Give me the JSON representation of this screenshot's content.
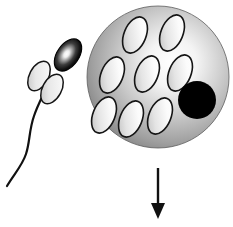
{
  "figure": {
    "width": 233,
    "height": 227,
    "background_color": "#ffffff"
  },
  "colors": {
    "outline": "#111111",
    "sperm_head_dark": "#0b0b0b",
    "sperm_head_highlight": "#ffffff",
    "sperm_midpiece_light": "#f2f2f2",
    "sperm_midpiece_shade": "#bdbdbd",
    "egg_edge_dark": "#5e5e5e",
    "egg_mid_gray": "#9a9a9a",
    "egg_highlight": "#ffffff",
    "vesicle_light": "#fbfbfb",
    "vesicle_shade": "#c4c4c4",
    "nucleus_black": "#000000",
    "arrow_black": "#111111"
  },
  "sperm": {
    "label": "sperm-cell",
    "head": {
      "label": "sperm-head-acrosome",
      "cx": 68,
      "cy": 55,
      "rx": 11,
      "ry": 18,
      "rotation": 35
    },
    "midpiece_ellipses": [
      {
        "label": "sperm-midpiece-upper-left",
        "cx": 39,
        "cy": 76,
        "rx": 9.5,
        "ry": 16,
        "rotation": 28
      },
      {
        "label": "sperm-midpiece-lower-right",
        "cx": 52,
        "cy": 89,
        "rx": 9.5,
        "ry": 16,
        "rotation": 28
      }
    ],
    "tail": {
      "label": "sperm-flagellum-tail",
      "stroke_width": 2.2,
      "path": "M 50 80 C 44 94, 38 104, 34 116 C 29 130, 30 142, 26 154 C 22 166, 14 174, 7 186"
    }
  },
  "egg": {
    "label": "egg-cell-oocyte",
    "cx": 158,
    "cy": 77,
    "r": 71,
    "vesicles": [
      {
        "label": "vesicle-top-left",
        "cx": 135,
        "cy": 35,
        "rx": 11,
        "ry": 19,
        "rotation": 22
      },
      {
        "label": "vesicle-top-right",
        "cx": 172,
        "cy": 33,
        "rx": 11,
        "ry": 19,
        "rotation": 22
      },
      {
        "label": "vesicle-middle-left",
        "cx": 112,
        "cy": 75,
        "rx": 11,
        "ry": 19,
        "rotation": 22
      },
      {
        "label": "vesicle-middle-center",
        "cx": 147,
        "cy": 74,
        "rx": 11,
        "ry": 19,
        "rotation": 22
      },
      {
        "label": "vesicle-middle-right",
        "cx": 180,
        "cy": 73,
        "rx": 11,
        "ry": 19,
        "rotation": 22
      },
      {
        "label": "vesicle-bottom-left",
        "cx": 104,
        "cy": 115,
        "rx": 11,
        "ry": 19,
        "rotation": 22
      },
      {
        "label": "vesicle-bottom-center",
        "cx": 131,
        "cy": 119,
        "rx": 11,
        "ry": 19,
        "rotation": 22
      },
      {
        "label": "vesicle-bottom-right",
        "cx": 160,
        "cy": 116,
        "rx": 11,
        "ry": 19,
        "rotation": 22
      }
    ],
    "nucleus": {
      "label": "egg-nucleus-dark-body",
      "cx": 197,
      "cy": 100,
      "r": 19
    }
  },
  "arrow": {
    "label": "downward-arrow",
    "x": 158,
    "shaft_top_y": 168,
    "shaft_bottom_y": 205,
    "tip_y": 219,
    "head_half_width": 7,
    "stroke_width": 2.4
  }
}
